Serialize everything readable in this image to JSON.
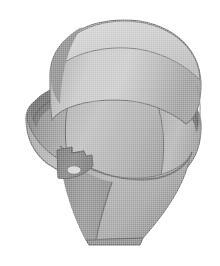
{
  "image": {
    "kind": "grayscale-halftone-3d-render",
    "subject_name": "conical valve body with cylindrical head, circumferential groove, flange and mounting tab",
    "background_color": "#ffffff",
    "canvas": {
      "width": 220,
      "height": 266
    },
    "object_bounds": {
      "left": 25,
      "top": 20,
      "right": 201,
      "bottom": 245
    },
    "orientation_note": "three-quarter view from above, light from upper left",
    "palette": {
      "highlight": "#cfcfcf",
      "light": "#bdbdbd",
      "mid_light": "#ababab",
      "mid": "#9a9a9a",
      "mid_dark": "#8a8a8a",
      "dark": "#767676",
      "darker": "#636363",
      "darkest": "#4f4f4f",
      "outline": "#5a5a5a",
      "hole_fill": "#d8d8d8"
    },
    "parts": [
      {
        "name": "upper-cylinder-head",
        "label": "Upper cylindrical head",
        "shade": "#bdbdbd",
        "bounds": {
          "left": 48,
          "top": 20,
          "right": 201,
          "bottom": 120
        }
      },
      {
        "name": "top-dome-face",
        "label": "Top end face (elliptical)",
        "shade": "#cacaca",
        "bounds": {
          "left": 52,
          "top": 20,
          "right": 198,
          "bottom": 86
        }
      },
      {
        "name": "circumferential-groove",
        "label": "Circumferential groove band",
        "shade": "#767676",
        "bounds": {
          "left": 30,
          "top": 76,
          "right": 199,
          "bottom": 132
        }
      },
      {
        "name": "flange-ring",
        "label": "Flange ring",
        "shade": "#a8a8a8",
        "bounds": {
          "left": 26,
          "top": 86,
          "right": 200,
          "bottom": 186
        }
      },
      {
        "name": "left-flange-lobe",
        "label": "Left flange lobe (shadow side)",
        "shade": "#8a8a8a",
        "bounds": {
          "left": 25,
          "top": 92,
          "right": 88,
          "bottom": 168
        }
      },
      {
        "name": "right-flange-lobe",
        "label": "Right flange lobe",
        "shade": "#a0a0a0",
        "bounds": {
          "left": 150,
          "top": 96,
          "right": 201,
          "bottom": 188
        }
      },
      {
        "name": "tapered-cone-body",
        "label": "Tapered conical body",
        "shade": "#9a9a9a",
        "bounds": {
          "left": 56,
          "top": 130,
          "right": 190,
          "bottom": 245
        }
      },
      {
        "name": "cone-front-facet",
        "label": "Cone front facet (lighter)",
        "shade": "#a9a9a9",
        "bounds": {
          "left": 95,
          "top": 135,
          "right": 188,
          "bottom": 240
        }
      },
      {
        "name": "cone-left-facet",
        "label": "Cone left facet (darker)",
        "shade": "#8c8c8c",
        "bounds": {
          "left": 56,
          "top": 150,
          "right": 130,
          "bottom": 243
        }
      },
      {
        "name": "bottom-flat-cut",
        "label": "Flat bottom cut",
        "shade": "#8f8f8f",
        "bounds": {
          "left": 84,
          "top": 232,
          "right": 143,
          "bottom": 245
        }
      },
      {
        "name": "mounting-tab",
        "label": "Mounting tab with notch",
        "shade": "#7d7d7d",
        "bounds": {
          "left": 56,
          "top": 146,
          "right": 96,
          "bottom": 182
        }
      },
      {
        "name": "tab-hole",
        "label": "Tab through-hole",
        "shade": "#d8d8d8",
        "bounds": {
          "left": 67,
          "top": 165,
          "right": 81,
          "bottom": 175
        }
      }
    ],
    "features": [
      {
        "name": "groove-shadow-edge",
        "label": "Dark groove shadow sweeping across mid-body"
      },
      {
        "name": "flange-seam-line",
        "label": "Seam line where flange meets cone"
      },
      {
        "name": "cone-ridge-line",
        "label": "Vertical ridge line down cone front"
      },
      {
        "name": "tab-notch",
        "label": "Rectangular notch at top of mounting tab"
      }
    ]
  }
}
